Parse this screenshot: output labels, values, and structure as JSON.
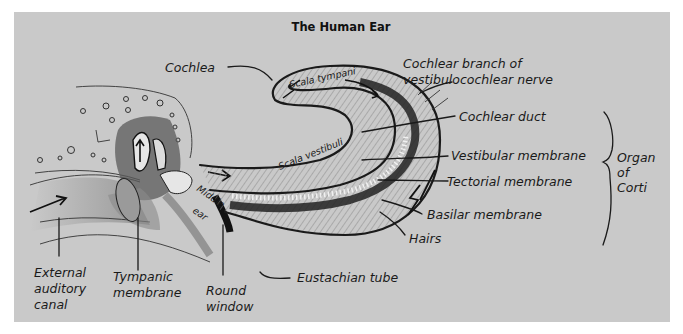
{
  "title": "The Human Ear",
  "labels": {
    "cochlea": "Cochlea",
    "cochlear_branch_line1": "Cochlear branch of",
    "cochlear_branch_line2": "vestibulocochlear nerve",
    "cochlear_duct": "Cochlear duct",
    "vestibular_membrane": "Vestibular membrane",
    "tectorial_membrane": "Tectorial membrane",
    "basilar_membrane": "Basilar membrane",
    "hairs": "Hairs",
    "eustachian_tube": "Eustachian tube",
    "round_window_line1": "Round",
    "round_window_line2": "window",
    "tympanic_line1": "Tympanic",
    "tympanic_line2": "membrane",
    "external_line1": "External",
    "external_line2": "auditory",
    "external_line3": "canal",
    "middle_ear_line1": "Middle",
    "middle_ear_line2": "ear",
    "scala_tympani": "Scala tympani",
    "scala_vestibuli": "Scala vestibuli",
    "organ_line1": "Organ",
    "organ_line2": "of",
    "organ_line3": "Corti"
  },
  "colors": {
    "background": "#c9c9c9",
    "ink": "#1a1a1a",
    "page": "#ffffff"
  }
}
